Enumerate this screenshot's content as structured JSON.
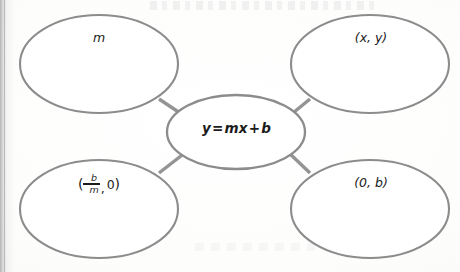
{
  "diagram": {
    "type": "concept-map",
    "title": "",
    "center_node": {
      "id": "center",
      "text": "y = mx + b",
      "parts": {
        "lhs": "y",
        "equals": "=",
        "rhs_1": "mx",
        "plus": "+",
        "rhs_2": "b"
      },
      "style": "bold-italic"
    },
    "outer_nodes": [
      {
        "id": "top-left",
        "position": "top-left",
        "text": "m",
        "style": "italic"
      },
      {
        "id": "top-right",
        "position": "top-right",
        "text": "(x, y)",
        "style": "italic"
      },
      {
        "id": "bottom-left",
        "position": "bottom-left",
        "text": "(-b/m, 0)",
        "style": "italic",
        "fraction": {
          "open_paren": "(",
          "sign": "−",
          "numerator": "b",
          "denominator": "m",
          "comma": ",",
          "second": "0",
          "close_paren": ")"
        }
      },
      {
        "id": "bottom-right",
        "position": "bottom-right",
        "text": "(0, b)",
        "style": "italic"
      }
    ],
    "connectors": [
      {
        "from": "center",
        "to": "top-left"
      },
      {
        "from": "center",
        "to": "top-right"
      },
      {
        "from": "center",
        "to": "bottom-left"
      },
      {
        "from": "center",
        "to": "bottom-right"
      }
    ],
    "colors": {
      "stroke": "#8c8c8c",
      "connector": "#949494",
      "fill": "#ffffff",
      "text": "#1b1b1b",
      "background": "#fcfcfb"
    }
  }
}
